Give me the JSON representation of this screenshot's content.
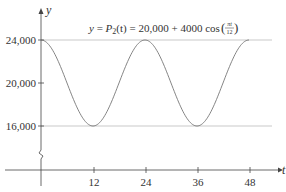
{
  "chart_data": {
    "type": "line",
    "equation": {
      "lhs": "y = ",
      "func": "P",
      "sub": "2",
      "args": "(t) = 20,000 + 4000 cos",
      "frac_num": "πt",
      "frac_den": "12"
    },
    "xlabel": "t",
    "ylabel": "y",
    "x_ticks": [
      "12",
      "24",
      "36",
      "48"
    ],
    "y_ticks": [
      "16,000",
      "20,000",
      "24,000"
    ],
    "xlim": [
      0,
      52
    ],
    "ylim": [
      16000,
      24000
    ],
    "y_axis_break": true,
    "reference_lines": [
      24000,
      16000
    ],
    "series": [
      {
        "name": "P2(t)",
        "x": [
          0,
          6,
          12,
          18,
          24,
          30,
          36,
          42,
          48
        ],
        "values": [
          24000,
          20000,
          16000,
          20000,
          24000,
          20000,
          16000,
          20000,
          24000
        ]
      }
    ],
    "grid": false,
    "legend": "none"
  }
}
